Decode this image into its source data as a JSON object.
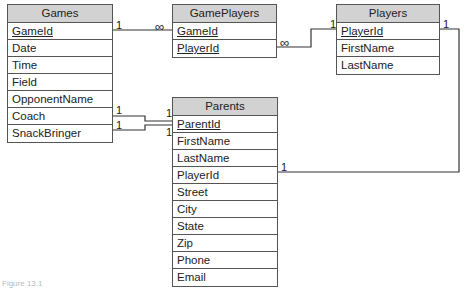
{
  "tables": {
    "games": {
      "title": "Games",
      "fields": [
        "GameId",
        "Date",
        "Time",
        "Field",
        "OpponentName",
        "Coach",
        "SnackBringer"
      ]
    },
    "gameplayers": {
      "title": "GamePlayers",
      "fields": [
        "GameId",
        "PlayerId"
      ]
    },
    "players": {
      "title": "Players",
      "fields": [
        "PlayerId",
        "FirstName",
        "LastName"
      ]
    },
    "parents": {
      "title": "Parents",
      "fields": [
        "ParentId",
        "FirstName",
        "LastName",
        "PlayerId",
        "Street",
        "City",
        "State",
        "Zip",
        "Phone",
        "Email"
      ]
    }
  },
  "relationships": {
    "games_gameplayers": {
      "from": "1",
      "to": "∞"
    },
    "gameplayers_players": {
      "from": "∞",
      "to": "1"
    },
    "games_coach_parents": {
      "from": "1",
      "to": "1"
    },
    "games_snack_parents": {
      "from": "1",
      "to": "1"
    },
    "players_parents": {
      "from": "1",
      "to": "1"
    }
  },
  "caption": "Figure 13.1"
}
